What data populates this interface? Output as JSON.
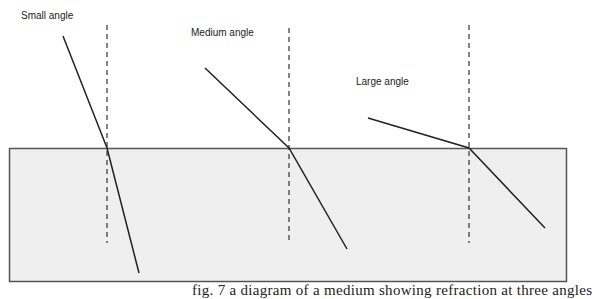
{
  "diagram": {
    "labels": {
      "small": "Small angle",
      "medium": "Medium angle",
      "large": "Large angle"
    },
    "caption": "fig. 7  a diagram of a medium showing refraction at three angles",
    "colors": {
      "medium_fill": "#efefef",
      "border": "#555555",
      "ray": "#222222",
      "normal": "#333333"
    },
    "medium_block": {
      "x": 9,
      "y": 148,
      "width": 558,
      "height": 134
    },
    "rays": [
      {
        "name": "small",
        "incident_start": [
          63,
          36
        ],
        "interface_point": [
          107,
          148
        ],
        "refracted_end": [
          139,
          273
        ],
        "normal_x": 107,
        "normal_y": [
          25,
          243
        ]
      },
      {
        "name": "medium",
        "incident_start": [
          205,
          68
        ],
        "interface_point": [
          289,
          148
        ],
        "refracted_end": [
          347,
          249
        ],
        "normal_x": 289,
        "normal_y": [
          28,
          240
        ]
      },
      {
        "name": "large",
        "incident_start": [
          368,
          118
        ],
        "interface_point": [
          469,
          148
        ],
        "refracted_end": [
          545,
          228
        ],
        "normal_x": 469,
        "normal_y": [
          25,
          243
        ]
      }
    ]
  }
}
